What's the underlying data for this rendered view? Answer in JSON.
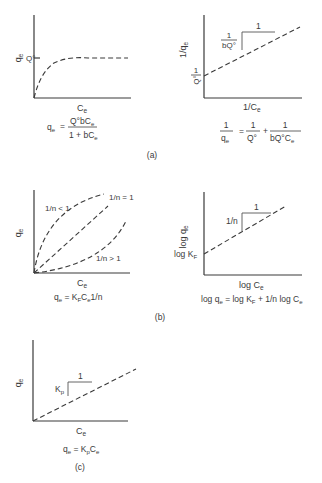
{
  "figure": {
    "panels": [
      {
        "id": "a",
        "caption": "(a)",
        "left": {
          "model": "Langmuir",
          "ylabel": "q",
          "ylabel_sub": "e",
          "xlabel": "C",
          "xlabel_sub": "e",
          "y_tick_label": "Q°",
          "formula": {
            "lhs": "q",
            "lhs_sub": "e",
            "eq": "=",
            "num": "Q°bC",
            "num_sub": "e",
            "den": "1 + bC",
            "den_sub": "e"
          }
        },
        "right": {
          "model": "Linearized Langmuir",
          "ylabel": "1/q",
          "ylabel_sub": "e",
          "xlabel": "1/C",
          "xlabel_sub": "e",
          "intercept_num": "1",
          "intercept_den": "Q°",
          "slope_num": "1",
          "slope_den": "bQ°",
          "run_label": "1",
          "formula": {
            "t1_num": "1",
            "t1_den": "q",
            "t1_den_sub": "e",
            "eq": "=",
            "t2_num": "1",
            "t2_den": "Q°",
            "plus": "+",
            "t3_num": "1",
            "t3_den": "bQ°C",
            "t3_den_sub": "e"
          }
        }
      },
      {
        "id": "b",
        "caption": "(b)",
        "left": {
          "model": "Freundlich",
          "ylabel": "q",
          "ylabel_sub": "e",
          "xlabel": "C",
          "xlabel_sub": "e",
          "curve_labels": [
            "1/n < 1",
            "1/n = 1",
            "1/n > 1"
          ],
          "formula": {
            "text": "q",
            "sub": "e",
            "rest": " = K",
            "rest_sub": "F",
            "tail": "C",
            "tail_sub": "e",
            "end": "1/n"
          }
        },
        "right": {
          "model": "Linearized Freundlich",
          "ylabel": "log q",
          "ylabel_sub": "e",
          "xlabel": "log C",
          "xlabel_sub": "e",
          "intercept": "log K",
          "intercept_sub": "F",
          "slope_label": "1/n",
          "run_label": "1",
          "formula": {
            "a": "log q",
            "a_sub": "e",
            "b": " = log K",
            "b_sub": "F",
            "c": " + 1/n log C",
            "c_sub": "e"
          }
        }
      },
      {
        "id": "c",
        "caption": "(c)",
        "left": {
          "model": "Linear",
          "ylabel": "q",
          "ylabel_sub": "e",
          "xlabel": "C",
          "xlabel_sub": "e",
          "slope_label": "K",
          "slope_label_sub": "p",
          "run_label": "1",
          "formula": {
            "a": "q",
            "a_sub": "e",
            "b": " = K",
            "b_sub": "p",
            "c": "C",
            "c_sub": "e"
          }
        }
      }
    ]
  }
}
